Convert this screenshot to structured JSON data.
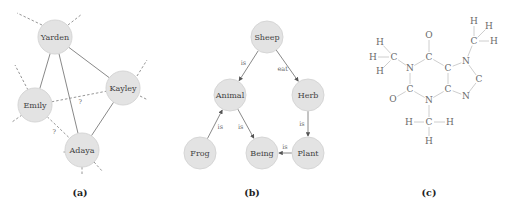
{
  "panels": {
    "a": {
      "caption": "(a)",
      "nodes": [
        {
          "id": "yarden",
          "label": "Yarden",
          "x": 55,
          "y": 37
        },
        {
          "id": "kayley",
          "label": "Kayley",
          "x": 123,
          "y": 88
        },
        {
          "id": "emily",
          "label": "Emily",
          "x": 35,
          "y": 105
        },
        {
          "id": "adaya",
          "label": "Adaya",
          "x": 82,
          "y": 150
        }
      ],
      "edges": [
        {
          "from": "yarden",
          "to": "kayley",
          "style": "solid"
        },
        {
          "from": "yarden",
          "to": "emily",
          "style": "solid"
        },
        {
          "from": "yarden",
          "to": "adaya",
          "style": "solid"
        },
        {
          "from": "kayley",
          "to": "adaya",
          "style": "solid"
        },
        {
          "from": "emily",
          "to": "kayley",
          "style": "dashed",
          "label": "?"
        },
        {
          "from": "emily",
          "to": "adaya",
          "style": "dashed",
          "label": "?"
        }
      ]
    },
    "b": {
      "caption": "(b)",
      "nodes": [
        {
          "id": "sheep",
          "label": "Sheep",
          "x": 267,
          "y": 37
        },
        {
          "id": "animal",
          "label": "Animal",
          "x": 230,
          "y": 95
        },
        {
          "id": "herb",
          "label": "Herb",
          "x": 308,
          "y": 95
        },
        {
          "id": "frog",
          "label": "Frog",
          "x": 200,
          "y": 153
        },
        {
          "id": "being",
          "label": "Being",
          "x": 262,
          "y": 153
        },
        {
          "id": "plant",
          "label": "Plant",
          "x": 308,
          "y": 153
        }
      ],
      "edges": [
        {
          "from": "sheep",
          "to": "animal",
          "label": "is"
        },
        {
          "from": "sheep",
          "to": "herb",
          "label": "eat"
        },
        {
          "from": "frog",
          "to": "animal",
          "label": "is"
        },
        {
          "from": "animal",
          "to": "being",
          "label": "is"
        },
        {
          "from": "herb",
          "to": "plant",
          "label": "is"
        },
        {
          "from": "plant",
          "to": "being",
          "label": "is"
        }
      ]
    },
    "c": {
      "caption": "(c)",
      "molecule": "caffeine",
      "atoms": [
        {
          "id": "o1",
          "el": "O",
          "x": 429,
          "y": 35
        },
        {
          "id": "c1",
          "el": "C",
          "x": 429,
          "y": 57
        },
        {
          "id": "n1",
          "el": "N",
          "x": 410,
          "y": 68
        },
        {
          "id": "c2",
          "el": "C",
          "x": 410,
          "y": 89
        },
        {
          "id": "o2",
          "el": "O",
          "x": 393,
          "y": 99
        },
        {
          "id": "n3",
          "el": "N",
          "x": 429,
          "y": 100
        },
        {
          "id": "c4",
          "el": "C",
          "x": 448,
          "y": 89
        },
        {
          "id": "c5",
          "el": "C",
          "x": 448,
          "y": 68
        },
        {
          "id": "n7",
          "el": "N",
          "x": 466,
          "y": 61
        },
        {
          "id": "c8",
          "el": "C",
          "x": 479,
          "y": 79
        },
        {
          "id": "n9",
          "el": "N",
          "x": 466,
          "y": 96
        },
        {
          "id": "cm1",
          "el": "C",
          "x": 394,
          "y": 57
        },
        {
          "id": "h1a",
          "el": "H",
          "x": 380,
          "y": 42
        },
        {
          "id": "h1b",
          "el": "H",
          "x": 373,
          "y": 57
        },
        {
          "id": "h1c",
          "el": "H",
          "x": 380,
          "y": 71
        },
        {
          "id": "cm3",
          "el": "C",
          "x": 429,
          "y": 122
        },
        {
          "id": "h3a",
          "el": "H",
          "x": 409,
          "y": 122
        },
        {
          "id": "h3b",
          "el": "H",
          "x": 450,
          "y": 122
        },
        {
          "id": "h3c",
          "el": "H",
          "x": 429,
          "y": 141
        },
        {
          "id": "cm7",
          "el": "C",
          "x": 474,
          "y": 41
        },
        {
          "id": "h7a",
          "el": "H",
          "x": 474,
          "y": 21
        },
        {
          "id": "h7b",
          "el": "H",
          "x": 489,
          "y": 26
        },
        {
          "id": "h7c",
          "el": "H",
          "x": 494,
          "y": 41
        }
      ],
      "bonds": [
        [
          "o1",
          "c1"
        ],
        [
          "c1",
          "n1"
        ],
        [
          "n1",
          "c2"
        ],
        [
          "c2",
          "o2"
        ],
        [
          "c2",
          "n3"
        ],
        [
          "n3",
          "c4"
        ],
        [
          "c4",
          "c5"
        ],
        [
          "c5",
          "c1"
        ],
        [
          "c5",
          "n7"
        ],
        [
          "n7",
          "c8"
        ],
        [
          "c8",
          "n9"
        ],
        [
          "n9",
          "c4"
        ],
        [
          "n1",
          "cm1"
        ],
        [
          "cm1",
          "h1a"
        ],
        [
          "cm1",
          "h1b"
        ],
        [
          "cm1",
          "h1c"
        ],
        [
          "n3",
          "cm3"
        ],
        [
          "cm3",
          "h3a"
        ],
        [
          "cm3",
          "h3b"
        ],
        [
          "cm3",
          "h3c"
        ],
        [
          "n7",
          "cm7"
        ],
        [
          "cm7",
          "h7a"
        ],
        [
          "cm7",
          "h7b"
        ],
        [
          "cm7",
          "h7c"
        ]
      ]
    }
  }
}
